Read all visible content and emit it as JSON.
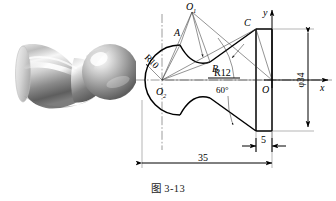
{
  "caption": "图 3-13",
  "photo": {
    "alt_name": "ball-handle-3d-render",
    "description": "3D shaded render of a ball handle part",
    "colors": {
      "highlight": "#f2f2f2",
      "midtone": "#9a9a9a",
      "shadow": "#4f4f4f",
      "background": "#ffffff"
    }
  },
  "drawing": {
    "title": "ball handle outline",
    "points": {
      "O1": "O",
      "O1_sub": "1",
      "O2": "O",
      "O2_sub": "2",
      "A": "A",
      "B": "B",
      "C": "C",
      "O": "O"
    },
    "axes": {
      "x": "x",
      "y": "y"
    },
    "radii": {
      "r10": "R10",
      "r12": "R12"
    },
    "angle": "60°",
    "dimensions": {
      "length_total": "35",
      "flange_width": "5",
      "diameter": "φ34"
    },
    "colors": {
      "outline": "#000000",
      "construction": "#3a3a3a",
      "centerline": "#4a4a4a",
      "dimension": "#000000"
    }
  }
}
